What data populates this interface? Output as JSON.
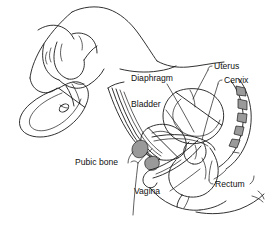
{
  "figure": {
    "background_color": "#ffffff",
    "ink_color": "#1a1a1a",
    "bone_shade_color": "#9a9a9a",
    "width": 266,
    "height": 228
  },
  "labels": [
    {
      "id": "diaphragm",
      "text": "Diaphragm",
      "x": 131,
      "y": 81,
      "anchor": "start"
    },
    {
      "id": "uterus",
      "text": "Uterus",
      "x": 214,
      "y": 69,
      "anchor": "start"
    },
    {
      "id": "cervix",
      "text": "Cervix",
      "x": 224,
      "y": 83,
      "anchor": "start"
    },
    {
      "id": "bladder",
      "text": "Bladder",
      "x": 131,
      "y": 107,
      "anchor": "start"
    },
    {
      "id": "pubic-bone",
      "text": "Pubic bone",
      "x": 75,
      "y": 165,
      "anchor": "start"
    },
    {
      "id": "vagina",
      "text": "Vagina",
      "x": 134,
      "y": 194,
      "anchor": "start"
    },
    {
      "id": "rectum",
      "text": "Rectum",
      "x": 215,
      "y": 187,
      "anchor": "start"
    }
  ],
  "parts": {
    "hand": "hand holding folded diaphragm",
    "diaphragm_device": "folded contraceptive diaphragm rim",
    "abdominal_wall": "anterior abdominal wall",
    "uterus": "uterus",
    "cervix": "cervix",
    "bladder": "bladder",
    "pubic_bone": "pubic bone cross-section",
    "vagina": "vaginal canal",
    "rectum": "rectum",
    "sacrum": "sacral vertebrae",
    "thigh": "thigh and buttock contour"
  }
}
